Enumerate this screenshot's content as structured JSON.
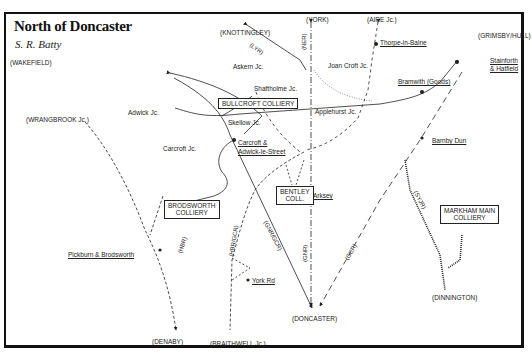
{
  "map": {
    "title": "North of Doncaster",
    "author": "S. R. Batty"
  },
  "destinations": {
    "wakefield": "(WAKEFIELD)",
    "knottingley": "(KNOTTINGLEY)",
    "york": "(YORK)",
    "aire_jc": "(AIRE Jc.)",
    "grimsby_hull": "(GRIMSBY/HULL)",
    "wrangbrook_jc": "(WRANGBROOK Jc.)",
    "denaby": "(DENABY)",
    "braithwell_jc": "(BRAITHWELL Jc.)",
    "doncaster": "(DONCASTER)",
    "dinnington": "(DINNINGTON)"
  },
  "junctions": {
    "askern": "Askern Jc.",
    "joan_croft": "Joan Croft Jc.",
    "shaftholme": "Shaftholme Jc.",
    "adwick": "Adwick Jc.",
    "skellow": "Skellow Jc.",
    "carcroft": "Carcroft Jc.",
    "applehurst": "Applehurst Jc."
  },
  "stations": {
    "thorpe_in_balne": "Thorpe-in-Balne",
    "bramwith": "Bramwith (Goods)",
    "stainforth_line1": "Stainforth",
    "stainforth_line2": "& Hatfield",
    "carcroft_adwick_line1": "Carcroft &",
    "carcroft_adwick_line2": "Adwick-le-Street",
    "barnby_dun": "Barnby Dun",
    "arksey": "Arksey",
    "pickburn": "Pickburn & Brodsworth",
    "york_rd": "York Rd"
  },
  "collieries": {
    "bullcroft": "BULLCROFT COLLIERY",
    "brodsworth_line1": "BRODSWORTH",
    "brodsworth_line2": "COLLIERY",
    "bentley_line1": "BENTLEY",
    "bentley_line2": "COLL.",
    "markham_line1": "MARKHAM MAIN",
    "markham_line2": "COLLIERY"
  },
  "companies": {
    "lyr": "(LYR)",
    "ner": "(NER)",
    "hbr": "(HBR)",
    "hbr_gcr": "(HBR/GCR)",
    "gnr_gcr": "(GNR/GCR)",
    "gnr": "(GNR)",
    "gcr": "(GCR)",
    "syjr": "(SYJR)"
  },
  "colors": {
    "ink": "#222222",
    "frame": "#111111",
    "paper": "#ffffff"
  }
}
